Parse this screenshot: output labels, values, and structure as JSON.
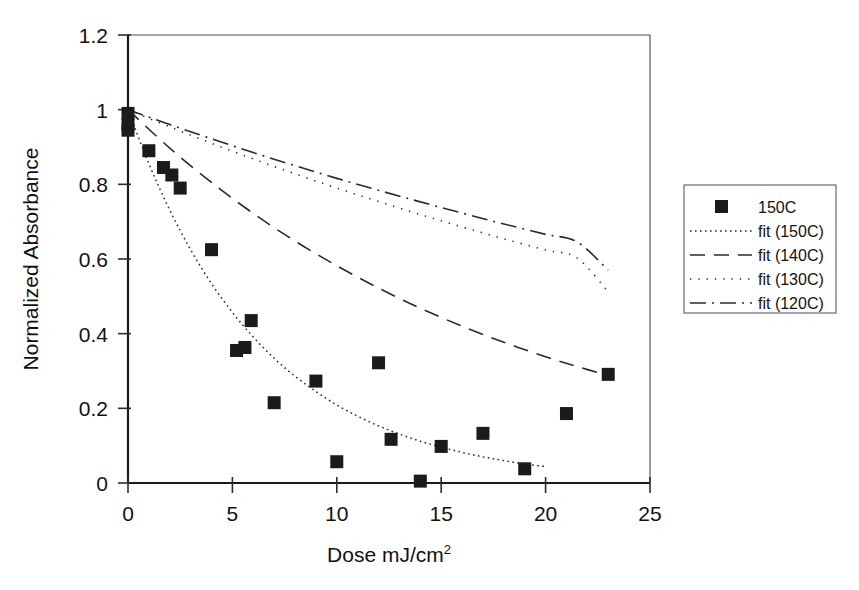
{
  "chart_data": {
    "type": "scatter",
    "title": "",
    "xlabel": "Dose mJ/cm2",
    "xlabel_base": "Dose mJ/cm",
    "xlabel_sup": "2",
    "ylabel": "Normalized Absorbance",
    "xlim": [
      0,
      25
    ],
    "ylim": [
      0,
      1.2
    ],
    "xticks": [
      0,
      5,
      10,
      15,
      20,
      25
    ],
    "xtick_labels": [
      "0",
      "5",
      "10",
      "15",
      "20",
      "25"
    ],
    "yticks": [
      0,
      0.2,
      0.4,
      0.6,
      0.8,
      1,
      1.2
    ],
    "ytick_labels": [
      "0",
      "0.2",
      "0.4",
      "0.6",
      "0.8",
      "1",
      "1.2"
    ],
    "grid": false,
    "legend_position": "right-outside",
    "series": [
      {
        "name": "150C",
        "kind": "scatter",
        "marker": "filled-square",
        "color": "#1b1b1b",
        "points": [
          [
            0.0,
            0.99
          ],
          [
            0.0,
            0.96
          ],
          [
            0.0,
            0.945
          ],
          [
            1.0,
            0.89
          ],
          [
            1.7,
            0.845
          ],
          [
            2.1,
            0.825
          ],
          [
            2.5,
            0.79
          ],
          [
            4.0,
            0.625
          ],
          [
            5.2,
            0.355
          ],
          [
            5.6,
            0.363
          ],
          [
            5.9,
            0.435
          ],
          [
            7.0,
            0.215
          ],
          [
            9.0,
            0.273
          ],
          [
            10.0,
            0.057
          ],
          [
            12.0,
            0.322
          ],
          [
            12.6,
            0.117
          ],
          [
            14.0,
            0.005
          ],
          [
            15.0,
            0.098
          ],
          [
            17.0,
            0.133
          ],
          [
            19.0,
            0.038
          ],
          [
            21.0,
            0.186
          ],
          [
            23.0,
            0.291
          ]
        ]
      },
      {
        "name": "fit (150C)",
        "kind": "line",
        "style": "dotted",
        "color": "#2a2a2a",
        "points": [
          [
            0.0,
            1.0
          ],
          [
            1.0,
            0.855
          ],
          [
            2.0,
            0.731
          ],
          [
            3.0,
            0.625
          ],
          [
            4.0,
            0.534
          ],
          [
            5.0,
            0.457
          ],
          [
            6.0,
            0.391
          ],
          [
            7.0,
            0.334
          ],
          [
            8.0,
            0.286
          ],
          [
            9.0,
            0.245
          ],
          [
            10.0,
            0.209
          ],
          [
            11.0,
            0.179
          ],
          [
            12.0,
            0.153
          ],
          [
            13.0,
            0.131
          ],
          [
            14.0,
            0.112
          ],
          [
            15.0,
            0.096
          ],
          [
            16.0,
            0.082
          ],
          [
            17.0,
            0.07
          ],
          [
            18.0,
            0.06
          ],
          [
            19.0,
            0.051
          ],
          [
            20.0,
            0.044
          ]
        ]
      },
      {
        "name": "fit (140C)",
        "kind": "line",
        "style": "dashed",
        "color": "#2a2a2a",
        "points": [
          [
            0.0,
            1.0
          ],
          [
            2.0,
            0.897
          ],
          [
            4.0,
            0.805
          ],
          [
            6.0,
            0.722
          ],
          [
            8.0,
            0.648
          ],
          [
            10.0,
            0.582
          ],
          [
            12.0,
            0.522
          ],
          [
            14.0,
            0.468
          ],
          [
            16.0,
            0.42
          ],
          [
            18.0,
            0.377
          ],
          [
            20.0,
            0.338
          ],
          [
            21.5,
            0.312
          ],
          [
            23.0,
            0.288
          ]
        ]
      },
      {
        "name": "fit (130C)",
        "kind": "line",
        "style": "fine-dotted",
        "color": "#2a2a2a",
        "points": [
          [
            0.0,
            1.0
          ],
          [
            2.0,
            0.954
          ],
          [
            4.0,
            0.91
          ],
          [
            6.0,
            0.868
          ],
          [
            8.0,
            0.828
          ],
          [
            10.0,
            0.79
          ],
          [
            12.0,
            0.754
          ],
          [
            14.0,
            0.719
          ],
          [
            16.0,
            0.686
          ],
          [
            18.0,
            0.654
          ],
          [
            20.0,
            0.624
          ],
          [
            21.5,
            0.603
          ],
          [
            23.0,
            0.512
          ]
        ]
      },
      {
        "name": "fit (120C)",
        "kind": "line",
        "style": "dash-dot",
        "color": "#2a2a2a",
        "points": [
          [
            0.0,
            1.0
          ],
          [
            2.0,
            0.96
          ],
          [
            4.0,
            0.922
          ],
          [
            6.0,
            0.885
          ],
          [
            8.0,
            0.85
          ],
          [
            10.0,
            0.816
          ],
          [
            12.0,
            0.784
          ],
          [
            14.0,
            0.753
          ],
          [
            16.0,
            0.723
          ],
          [
            18.0,
            0.694
          ],
          [
            20.0,
            0.666
          ],
          [
            21.5,
            0.646
          ],
          [
            23.0,
            0.57
          ]
        ]
      }
    ]
  },
  "legend": {
    "entries": [
      {
        "label": "150C",
        "symbol": "filled-square"
      },
      {
        "label": "fit (150C)",
        "symbol": "dotted-line"
      },
      {
        "label": "fit (140C)",
        "symbol": "dashed-line"
      },
      {
        "label": "fit (130C)",
        "symbol": "fine-dotted-line"
      },
      {
        "label": "fit (120C)",
        "symbol": "dash-dot-line"
      }
    ]
  }
}
